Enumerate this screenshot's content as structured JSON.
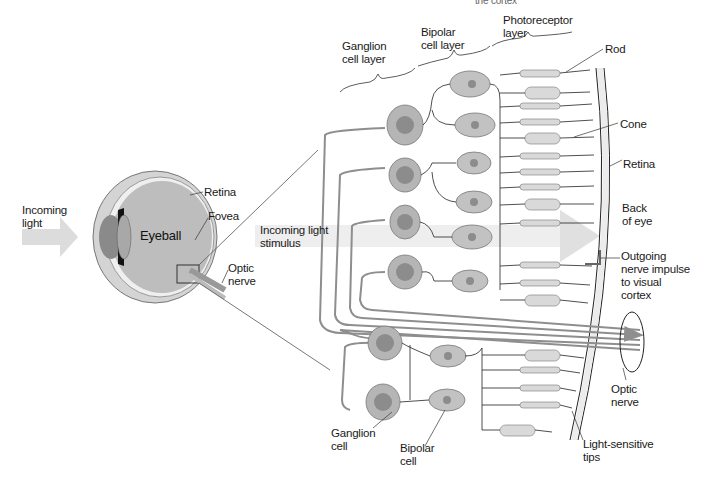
{
  "diagram": {
    "type": "anatomy-diagram",
    "colors": {
      "cell_fill": "#b5b5b5",
      "nucleus_fill": "#8c8c8c",
      "photoreceptor_fill": "#d9d9d9",
      "axon_stroke": "#8e8e8e",
      "line_stroke": "#222222",
      "light_arrow": "#e3e3e3",
      "retina_band": "#ececec"
    },
    "top_cutoff_text": "the cortex",
    "layers": {
      "ganglion": "Ganglion\ncell layer",
      "bipolar": "Bipolar\ncell layer",
      "photoreceptor": "Photoreceptor\nlayer"
    },
    "eye": {
      "incoming_light": "Incoming\nlight",
      "eyeball": "Eyeball",
      "retina": "Retina",
      "fovea": "Fovea",
      "optic_nerve": "Optic\nnerve"
    },
    "retina_detail": {
      "incoming_stimulus": "Incoming light\nstimulus",
      "rod": "Rod",
      "cone": "Cone",
      "retina": "Retina",
      "back_of_eye": "Back\nof eye",
      "outgoing_impulse": "Outgoing\nnerve impulse\nto visual\ncortex",
      "optic_nerve": "Optic\nnerve",
      "light_sensitive_tips": "Light-sensitive\ntips",
      "ganglion_cell": "Ganglion\ncell",
      "bipolar_cell": "Bipolar\ncell"
    }
  }
}
